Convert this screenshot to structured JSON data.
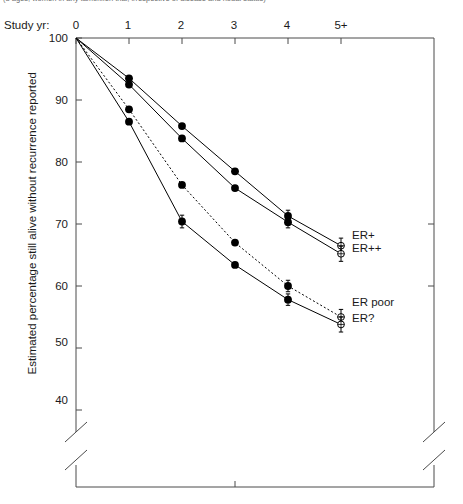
{
  "caption": "(3 ages, women in any tamoxifen trial, irrespective of disease and nodal status)",
  "axes": {
    "x_title": "Study yr:",
    "x_ticks": [
      "0",
      "1",
      "2",
      "3",
      "4",
      "5+"
    ],
    "y_title": "Estimated percentage still alive without recurrence reported",
    "y_ticks": [
      "100",
      "90",
      "80",
      "70",
      "60",
      "50",
      "40"
    ]
  },
  "legend": {
    "items": [
      {
        "label": "ER+"
      },
      {
        "label": "ER++"
      },
      {
        "label": "ER poor"
      },
      {
        "label": "ER?"
      }
    ]
  },
  "chart_data": {
    "type": "line",
    "title": "",
    "subtitle": "(3 ages, women in any tamoxifen trial, irrespective of disease and nodal status)",
    "xlabel": "Study yr:",
    "ylabel": "Estimated percentage still alive without recurrence reported",
    "x": [
      0,
      1,
      2,
      3,
      4,
      5
    ],
    "x_tick_labels": [
      "0",
      "1",
      "2",
      "3",
      "4",
      "5+"
    ],
    "y_ticks": [
      100,
      90,
      80,
      70,
      60,
      50,
      40
    ],
    "ylim": [
      38,
      100
    ],
    "y_axis_break": true,
    "grid": false,
    "legend_position": "right-inline",
    "series": [
      {
        "name": "ER+",
        "linestyle": "solid",
        "marker": "filled-circle",
        "endpoint_marker": "open-circle",
        "values": [
          100,
          93.5,
          85.8,
          78.5,
          71.3,
          66.5
        ],
        "errorbars": [
          0,
          0,
          0,
          0,
          0.6,
          0.9
        ]
      },
      {
        "name": "ER++",
        "linestyle": "solid",
        "marker": "filled-circle",
        "endpoint_marker": "open-circle",
        "values": [
          100,
          92.5,
          83.8,
          75.8,
          70.3,
          65.2
        ],
        "errorbars": [
          0,
          0,
          0,
          0,
          0.6,
          0.9
        ]
      },
      {
        "name": "ER poor",
        "linestyle": "dashed",
        "marker": "filled-circle",
        "endpoint_marker": "open-circle",
        "values": [
          100,
          88.5,
          76.3,
          67.0,
          60.0,
          55.0
        ],
        "errorbars": [
          0,
          0,
          0,
          0,
          0.6,
          0.9
        ]
      },
      {
        "name": "ER?",
        "linestyle": "solid",
        "marker": "filled-circle",
        "endpoint_marker": "open-circle",
        "values": [
          100,
          86.5,
          70.4,
          63.4,
          57.8,
          53.8
        ],
        "errorbars": [
          0,
          0,
          0.7,
          0,
          0.6,
          0.9
        ]
      }
    ],
    "colors": {
      "line": "#000000",
      "marker": "#000000",
      "axis": "#4a4a4a",
      "text": "#1a1a1a"
    }
  }
}
